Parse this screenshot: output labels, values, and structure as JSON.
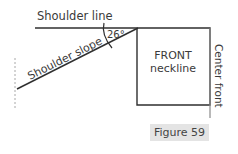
{
  "figure": {
    "caption": "Figure 59",
    "labels": {
      "shoulder_line": "Shoulder line",
      "shoulder_slope": "Shoulder slope",
      "angle": "26°",
      "front_neckline_line1": "FRONT",
      "front_neckline_line2": "neckline",
      "center_front": "Center front"
    },
    "colors": {
      "line": "#2f2f2f",
      "guide": "#9a9a9a",
      "text": "#3a3a3a",
      "caption_bg": "#e4e4e4"
    }
  }
}
